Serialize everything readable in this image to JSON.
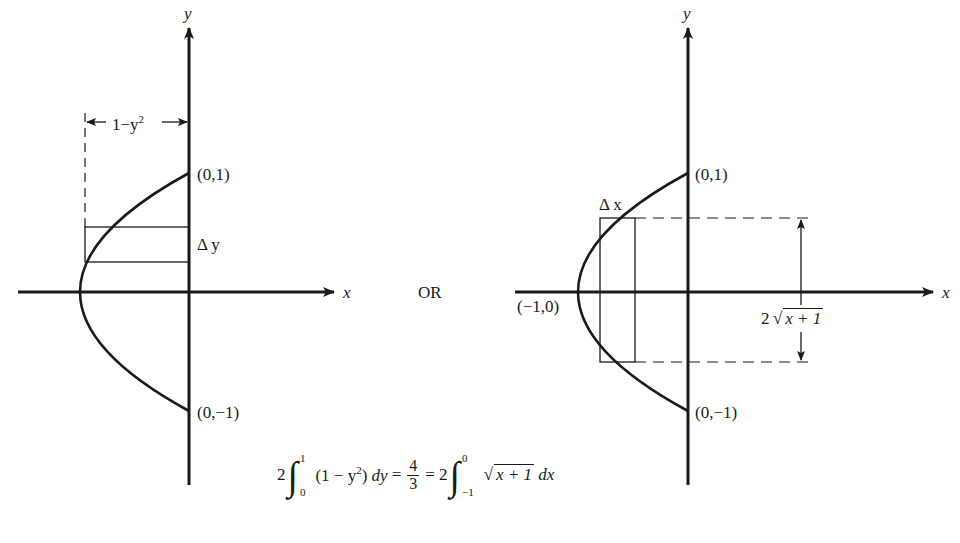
{
  "left_diagram": {
    "y_axis_label": "y",
    "x_axis_label": "x",
    "width_label": "1−y",
    "width_label_exp": "2",
    "point_top": "(0,1)",
    "point_bottom": "(0,−1)",
    "strip_label": "Δ y"
  },
  "separator": "OR",
  "right_diagram": {
    "y_axis_label": "y",
    "x_axis_label": "x",
    "point_top": "(0,1)",
    "point_bottom": "(0,−1)",
    "point_vertex": "(−1,0)",
    "strip_label": "Δ x",
    "height_label_coef": "2",
    "height_label_radicand": "x + 1"
  },
  "equation": {
    "coef1": "2",
    "int1_upper": "1",
    "int1_lower": "0",
    "int1_integrand": "(1 − y",
    "int1_exp": "2",
    "int1_close": ")",
    "int1_diff": "dy",
    "eq1": "=",
    "frac_num": "4",
    "frac_den": "3",
    "eq2": "= 2",
    "int2_upper": "0",
    "int2_lower": "−1",
    "int2_radicand": "x + 1",
    "int2_diff": "dx"
  },
  "colors": {
    "ink": "#1a1a1a",
    "background": "#ffffff"
  }
}
